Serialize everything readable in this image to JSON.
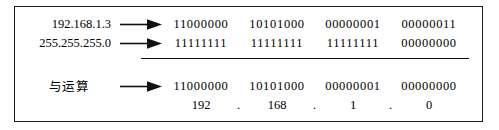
{
  "diagram": {
    "type": "ip-subnet-and-operation",
    "rows": [
      {
        "label": "192.168.1.3",
        "arrow_icon": "right-arrow-icon",
        "octets": [
          "11000000",
          "10101000",
          "00000001",
          "00000011"
        ]
      },
      {
        "label": "255.255.255.0",
        "arrow_icon": "right-arrow-icon",
        "octets": [
          "11111111",
          "11111111",
          "11111111",
          "00000000"
        ]
      },
      {
        "label": "与运算",
        "arrow_icon": "right-arrow-icon",
        "octets": [
          "11000000",
          "10101000",
          "00000001",
          "00000000"
        ]
      }
    ],
    "decimal_result": {
      "octets": [
        "192",
        "168",
        "1",
        "0"
      ],
      "separator": "."
    },
    "colors": {
      "border": "#1a1a1a",
      "text": "#000000",
      "background": "#ffffff",
      "rule": "#111111"
    }
  }
}
